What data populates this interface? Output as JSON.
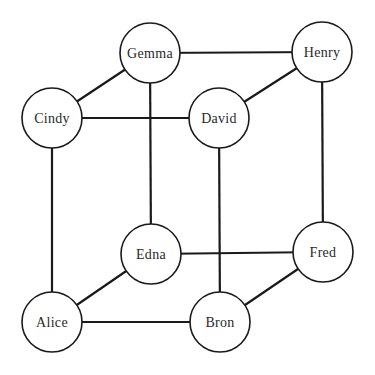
{
  "diagram": {
    "type": "graph",
    "node_radius": 30,
    "nodes": [
      {
        "id": "gemma",
        "label": "Gemma",
        "x": 150,
        "y": 53
      },
      {
        "id": "henry",
        "label": "Henry",
        "x": 322,
        "y": 52
      },
      {
        "id": "cindy",
        "label": "Cindy",
        "x": 52,
        "y": 118
      },
      {
        "id": "david",
        "label": "David",
        "x": 219,
        "y": 118
      },
      {
        "id": "edna",
        "label": "Edna",
        "x": 151,
        "y": 254
      },
      {
        "id": "fred",
        "label": "Fred",
        "x": 323,
        "y": 252
      },
      {
        "id": "alice",
        "label": "Alice",
        "x": 52,
        "y": 322
      },
      {
        "id": "bron",
        "label": "Bron",
        "x": 220,
        "y": 322
      }
    ],
    "edges": [
      [
        "gemma",
        "henry"
      ],
      [
        "gemma",
        "cindy"
      ],
      [
        "gemma",
        "edna"
      ],
      [
        "henry",
        "david"
      ],
      [
        "henry",
        "fred"
      ],
      [
        "cindy",
        "david"
      ],
      [
        "cindy",
        "alice"
      ],
      [
        "david",
        "bron"
      ],
      [
        "edna",
        "fred"
      ],
      [
        "edna",
        "alice"
      ],
      [
        "fred",
        "bron"
      ],
      [
        "alice",
        "bron"
      ]
    ]
  }
}
